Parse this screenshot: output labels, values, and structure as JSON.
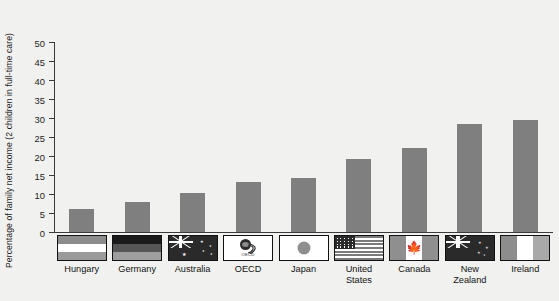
{
  "chart_data": {
    "type": "bar",
    "title": "",
    "xlabel": "",
    "ylabel": "Percentage of family net income (2 children in full-time care)",
    "ylim": [
      0,
      50
    ],
    "yticks": [
      0,
      5,
      10,
      15,
      20,
      25,
      30,
      35,
      40,
      45,
      50
    ],
    "grid": false,
    "legend": "none",
    "categories": [
      "Hungary",
      "Germany",
      "Australia",
      "OECD",
      "Japan",
      "United States",
      "Canada",
      "New Zealand",
      "Ireland"
    ],
    "values": [
      6.0,
      8.0,
      10.2,
      13.2,
      14.3,
      19.3,
      22.0,
      28.5,
      29.5
    ],
    "bar_color": "#7f7f7f",
    "background_color": "#f1f1ef",
    "axis_color": "#3a3a3a"
  },
  "axis": {
    "y_title": "Percentage of family net income (2 children in full-time care)",
    "tick_labels": [
      "0",
      "5",
      "10",
      "15",
      "20",
      "25",
      "30",
      "35",
      "40",
      "45",
      "50"
    ]
  },
  "flags": [
    {
      "country": "Hungary",
      "icon": "flag-hungary-icon"
    },
    {
      "country": "Germany",
      "icon": "flag-germany-icon"
    },
    {
      "country": "Australia",
      "icon": "flag-australia-icon"
    },
    {
      "country": "OECD",
      "icon": "oecd-logo-icon",
      "logo_text": "OECD"
    },
    {
      "country": "Japan",
      "icon": "flag-japan-icon"
    },
    {
      "country": "United States",
      "icon": "flag-united-states-icon"
    },
    {
      "country": "Canada",
      "icon": "flag-canada-icon"
    },
    {
      "country": "New Zealand",
      "icon": "flag-new-zealand-icon"
    },
    {
      "country": "Ireland",
      "icon": "flag-ireland-icon"
    }
  ],
  "x_labels": [
    {
      "line1": "Hungary",
      "line2": ""
    },
    {
      "line1": "Germany",
      "line2": ""
    },
    {
      "line1": "Australia",
      "line2": ""
    },
    {
      "line1": "OECD",
      "line2": ""
    },
    {
      "line1": "Japan",
      "line2": ""
    },
    {
      "line1": "United",
      "line2": "States"
    },
    {
      "line1": "Canada",
      "line2": ""
    },
    {
      "line1": "New",
      "line2": "Zealand"
    },
    {
      "line1": "Ireland",
      "line2": ""
    }
  ]
}
